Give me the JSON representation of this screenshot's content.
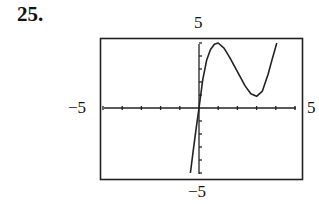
{
  "problem": {
    "number": "25."
  },
  "labels": {
    "ymax": "5",
    "ymin": "−5",
    "xmin": "−5",
    "xmax": "5"
  },
  "chart_data": {
    "type": "line",
    "title": "",
    "xlabel": "",
    "ylabel": "",
    "xlim": [
      -5,
      5
    ],
    "ylim": [
      -5,
      5
    ],
    "xticks": [
      -5,
      -4,
      -3,
      -2,
      -1,
      0,
      1,
      2,
      3,
      4,
      5
    ],
    "yticks": [
      -5,
      -4,
      -3,
      -2,
      -1,
      0,
      1,
      2,
      3,
      4,
      5
    ],
    "grid": false,
    "legend": null,
    "series": [
      {
        "name": "f(x)",
        "x": [
          -0.45,
          -0.3,
          -0.15,
          0,
          0.2,
          0.4,
          0.6,
          0.8,
          1.0,
          1.3,
          1.6,
          2.0,
          2.4,
          2.7,
          3.0,
          3.3,
          3.6,
          3.8,
          4.05
        ],
        "y": [
          -5.0,
          -3.3,
          -1.6,
          0,
          2.2,
          3.7,
          4.5,
          4.9,
          5.0,
          4.6,
          3.9,
          2.8,
          1.7,
          1.1,
          0.9,
          1.3,
          2.6,
          3.7,
          5.0
        ]
      }
    ],
    "annotations": {
      "window": "[-5, 5] by [-5, 5]",
      "local_max": [
        1.0,
        5.0
      ],
      "local_min": [
        3.0,
        0.9
      ]
    }
  }
}
